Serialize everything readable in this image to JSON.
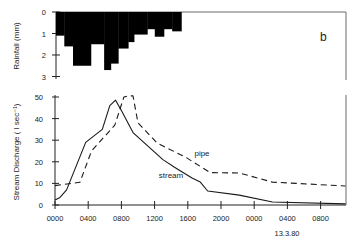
{
  "chart_data": [
    {
      "type": "bar",
      "panel": "rainfall",
      "title": "",
      "panel_label": "b",
      "ylabel": "Rainfall (mm)",
      "ylim": [
        0,
        3
      ],
      "y_inverted": true,
      "yticks": [
        0,
        1,
        2,
        3
      ],
      "x_unit": "hours from 0000",
      "bars": [
        {
          "x0": 0.0,
          "x1": 1.0,
          "value": 1.1
        },
        {
          "x0": 1.0,
          "x1": 2.05,
          "value": 1.6
        },
        {
          "x0": 2.05,
          "x1": 4.2,
          "value": 2.5
        },
        {
          "x0": 4.2,
          "x1": 5.8,
          "value": 1.5
        },
        {
          "x0": 5.8,
          "x1": 6.6,
          "value": 2.7
        },
        {
          "x0": 6.6,
          "x1": 7.5,
          "value": 2.4
        },
        {
          "x0": 7.5,
          "x1": 8.7,
          "value": 1.7
        },
        {
          "x0": 8.7,
          "x1": 9.4,
          "value": 1.4
        },
        {
          "x0": 9.4,
          "x1": 11.0,
          "value": 1.05
        },
        {
          "x0": 11.0,
          "x1": 11.9,
          "value": 0.8
        },
        {
          "x0": 11.9,
          "x1": 13.0,
          "value": 1.15
        },
        {
          "x0": 13.0,
          "x1": 14.0,
          "value": 0.8
        },
        {
          "x0": 14.0,
          "x1": 15.1,
          "value": 0.9
        }
      ]
    },
    {
      "type": "line",
      "panel": "discharge",
      "title": "",
      "ylabel": "Stream Discharge ( l sec⁻¹)",
      "xlabel": "",
      "ylim": [
        0,
        50
      ],
      "yticks": [
        0,
        10,
        20,
        30,
        40,
        50
      ],
      "xlim_hours": [
        0,
        35
      ],
      "xticks_hours": [
        0,
        4,
        8,
        12,
        16,
        20,
        24,
        28,
        32
      ],
      "xtick_labels": [
        "0000",
        "0400",
        "0800",
        "1200",
        "1600",
        "2000",
        "0000",
        "0400",
        "0800"
      ],
      "date_annotation": "13.3.80",
      "grid": false,
      "series": [
        {
          "name": "stream",
          "style": "solid",
          "x": [
            0,
            0.6,
            1.4,
            3.7,
            5.7,
            6.6,
            7.3,
            8.1,
            9.4,
            13.0,
            14.4,
            16.5,
            17.5,
            18.4,
            22.2,
            26.2,
            35
          ],
          "y": [
            2.3,
            3.5,
            7,
            29,
            35,
            46,
            48.5,
            43,
            33.5,
            21,
            17.5,
            12.5,
            10.6,
            6.5,
            4.6,
            1.4,
            0.5
          ]
        },
        {
          "name": "pipe",
          "style": "dashed",
          "x": [
            0,
            3.0,
            4.4,
            7.2,
            8.3,
            8.9,
            9.4,
            10.0,
            12.3,
            15.8,
            18.7,
            22.2,
            26.2,
            35
          ],
          "y": [
            9,
            10.5,
            25,
            37,
            50,
            50.5,
            50.5,
            38,
            28.7,
            22,
            15,
            14.8,
            10.6,
            8.8
          ]
        }
      ],
      "series_labels": [
        {
          "text": "pipe",
          "x_hours": 16.8,
          "y": 22.5
        },
        {
          "text": "stream",
          "x_hours": 12.5,
          "y": 12.5
        }
      ]
    }
  ]
}
